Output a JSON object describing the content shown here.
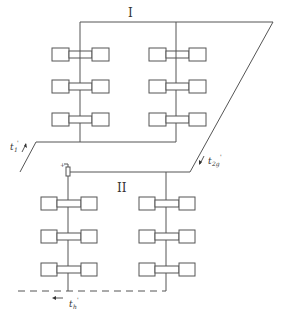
{
  "diagram": {
    "type": "heating-system-schematic",
    "zones": [
      {
        "id": "zone-1",
        "label": "I",
        "rows": 3,
        "columns": 2
      },
      {
        "id": "zone-2",
        "label": "II",
        "rows": 3,
        "columns": 2
      }
    ],
    "labels": {
      "zone_1": "I",
      "zone_2": "II",
      "supply_1": "t",
      "supply_1_sub": "1",
      "supply_1_prime": "'",
      "supply_2": "t",
      "supply_2_sub": "2g",
      "supply_2_prime": "'",
      "return": "t",
      "return_sub": "h",
      "return_prime": "'"
    },
    "colors": {
      "line": "#555555",
      "background": "#ffffff",
      "text": "#333333"
    }
  }
}
